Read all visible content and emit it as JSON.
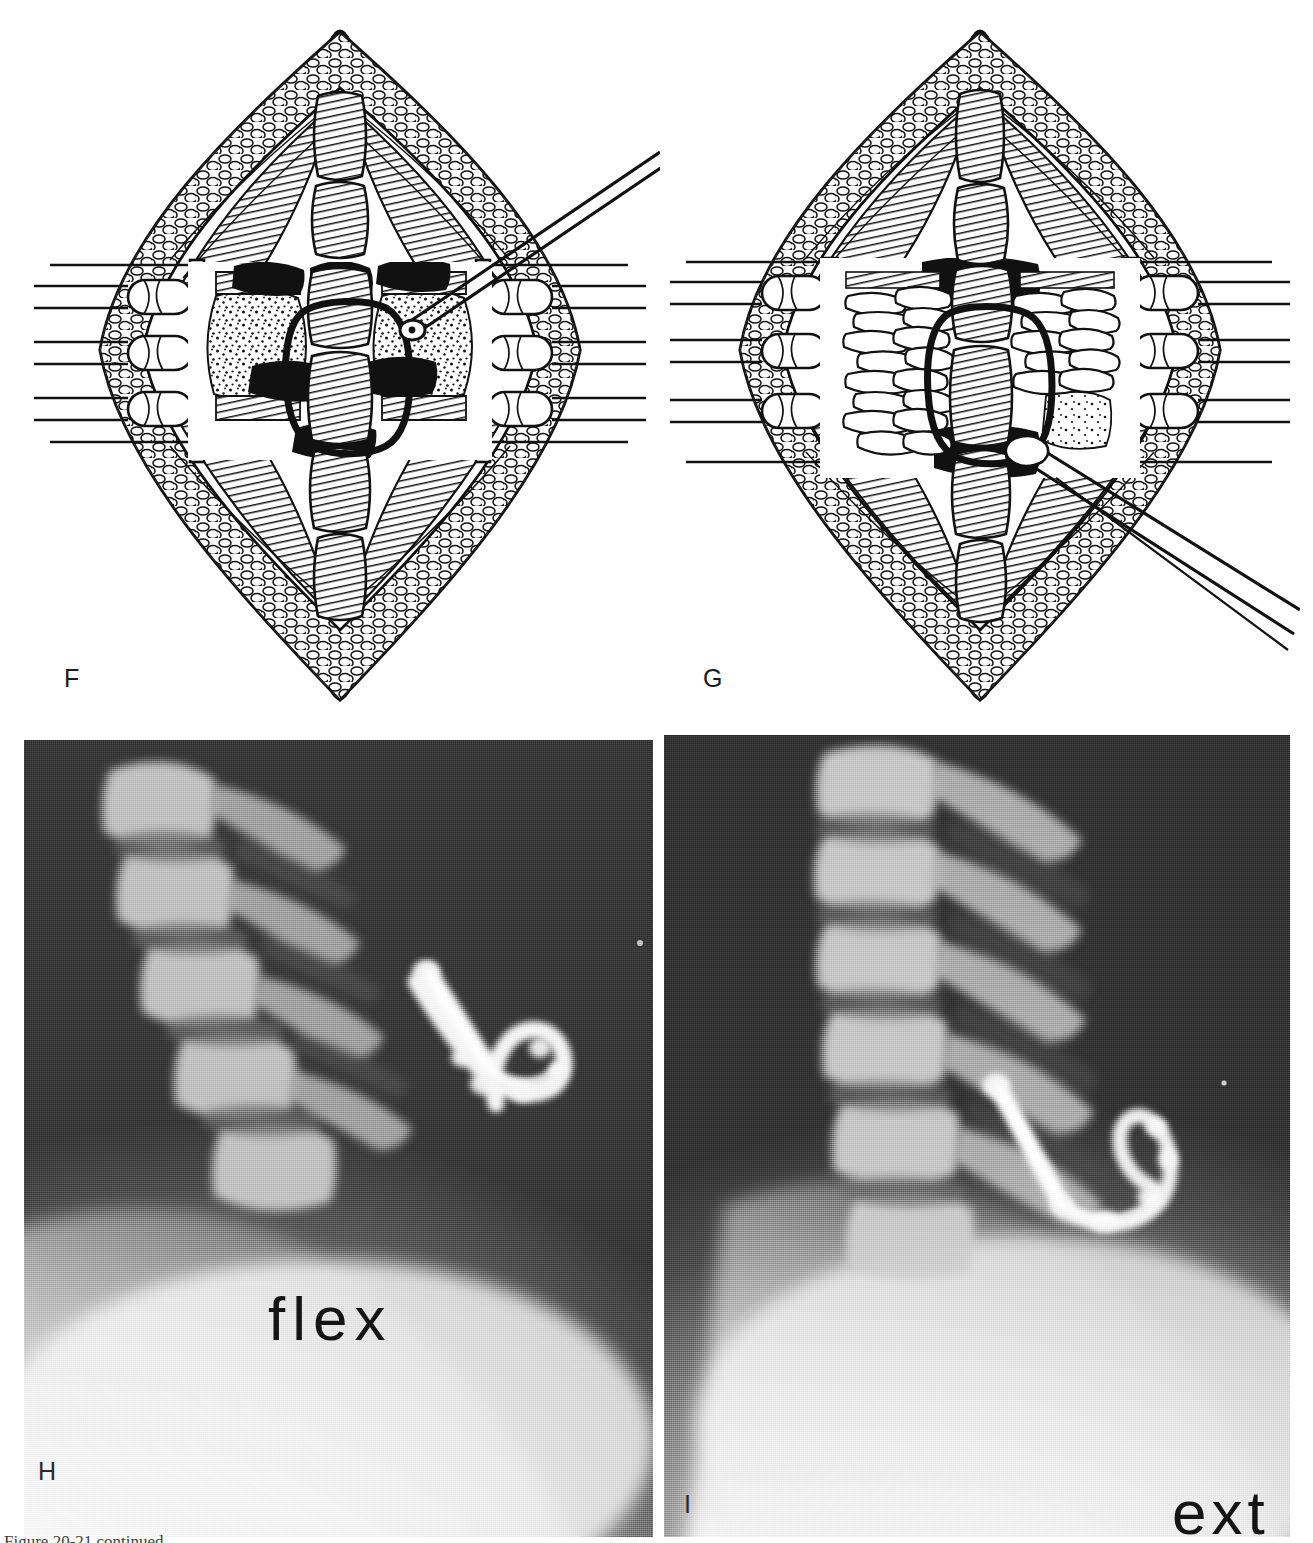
{
  "figure": {
    "kind": "surgical-technique-figure",
    "caption_partial": "Figure 20-21 continued",
    "panels": [
      {
        "id": "F",
        "label": "F",
        "type": "line-drawing",
        "subject": "Posterior cervical exposure with self-retaining retractors; decorticated lateral masses and facet joints prepared; wire loop around spinous process; curette/probe introduced from upper right",
        "elements": [
          "skin-and-subcutaneous-fat-edges",
          "paraspinal-muscle-flaps",
          "self-retaining-retractor-blades-left",
          "self-retaining-retractor-blades-right",
          "spinous-processes-midline",
          "decorticated-bone-bed",
          "interspinous-wire-loop",
          "curette-instrument"
        ]
      },
      {
        "id": "G",
        "label": "G",
        "type": "line-drawing",
        "subject": "Same exposure after corticocancellous bone graft strips are packed across the decorticated fusion bed; graft being delivered with forceps from lower right",
        "elements": [
          "skin-and-subcutaneous-fat-edges",
          "paraspinal-muscle-flaps",
          "self-retaining-retractor-blades-left",
          "self-retaining-retractor-blades-right",
          "spinous-processes-midline",
          "bone-graft-strips",
          "interspinous-wire-loop",
          "graft-forceps-instrument"
        ]
      },
      {
        "id": "H",
        "label": "H",
        "type": "radiograph",
        "view_label": "flex",
        "subject": "Lateral cervical spine radiograph in flexion showing posterior fusion mass and wire",
        "elements": [
          "cervical-vertebral-bodies",
          "spinous-processes",
          "posterior-fusion-mass",
          "interspinous-wire",
          "soft-tissue-shadow"
        ]
      },
      {
        "id": "I",
        "label": "I",
        "type": "radiograph",
        "view_label": "ext",
        "subject": "Lateral cervical spine radiograph in extension showing the same posterior fusion mass and wire, confirming stability",
        "elements": [
          "cervical-vertebral-bodies",
          "spinous-processes",
          "posterior-fusion-mass",
          "interspinous-wire",
          "soft-tissue-shadow"
        ]
      }
    ]
  },
  "colors": {
    "page_background": "#ffffff",
    "ink": "#111111",
    "label_text": "#1b1b1b",
    "film_text": "#161616",
    "film_dark": "#2b2b2b",
    "film_light": "#f2f2f2",
    "caption_text": "#3d3d3d"
  }
}
